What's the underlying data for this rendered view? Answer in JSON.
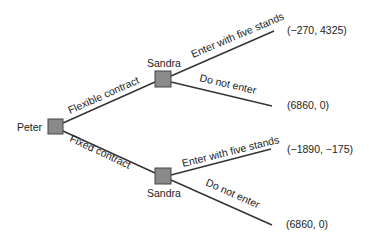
{
  "diagram": {
    "type": "game-tree",
    "nodes": {
      "root": {
        "player": "Peter"
      },
      "upper": {
        "player": "Sandra"
      },
      "lower": {
        "player": "Sandra"
      }
    },
    "edges": {
      "root_upper": "Flexible contract",
      "root_lower": "Fixed contract",
      "upper_enter": "Enter with five stands",
      "upper_not": "Do not enter",
      "lower_enter": "Enter with five stands",
      "lower_not": "Do not enter"
    },
    "payoffs": {
      "p1": "(−270, 4325)",
      "p2": "(6860, 0)",
      "p3": "(−1890, −175)",
      "p4": "(6860, 0)"
    },
    "colors": {
      "node_fill": "#8a8a8a",
      "line": "#333333"
    }
  }
}
